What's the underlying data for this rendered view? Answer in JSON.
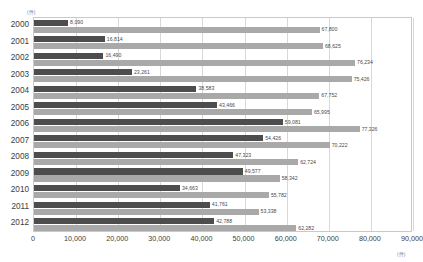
{
  "chart_data": {
    "type": "bar",
    "orientation": "horizontal",
    "title": "",
    "xlabel": "(件)",
    "ylabel": "(件)",
    "unit_top": "(件)",
    "unit_bottom": "(件)",
    "xlim": [
      0,
      90000
    ],
    "grid": true,
    "grid_axis": "x",
    "legend_position": "none",
    "xticks": [
      0,
      10000,
      20000,
      30000,
      40000,
      50000,
      60000,
      70000,
      80000,
      90000
    ],
    "xtick_labels": [
      "0",
      "10,000",
      "20,000",
      "30,000",
      "40,000",
      "50,000",
      "60,000",
      "70,000",
      "80,000",
      "90,000"
    ],
    "categories": [
      "2000",
      "2001",
      "2002",
      "2003",
      "2004",
      "2005",
      "2006",
      "2007",
      "2008",
      "2009",
      "2010",
      "2011",
      "2012"
    ],
    "series": [
      {
        "name": "series-dark",
        "color": "#4d4d4d",
        "values": [
          8090,
          16814,
          16490,
          23261,
          38583,
          43466,
          59081,
          54426,
          47323,
          49577,
          34663,
          41761,
          42788
        ],
        "value_labels": [
          "8,090",
          "16,814",
          "16,490",
          "23,261",
          "38,583",
          "43,466",
          "59,081",
          "54,426",
          "47,323",
          "49,577",
          "34,663",
          "41,761",
          "42,788"
        ]
      },
      {
        "name": "series-light",
        "color": "#a9a9a9",
        "values": [
          67800,
          68625,
          76234,
          75426,
          67752,
          65995,
          77326,
          70222,
          62724,
          58342,
          55782,
          53338,
          62282
        ],
        "value_labels": [
          "67,800",
          "68,625",
          "76,234",
          "75,426",
          "67,752",
          "65,995",
          "77,326",
          "70,222",
          "62,724",
          "58,342",
          "55,782",
          "53,338",
          "62,282"
        ]
      }
    ]
  },
  "colors": {
    "dark_bar": "#4d4d4d",
    "light_bar": "#a9a9a9",
    "gridline": "#d8d8d8",
    "frame": "#c9c9c9",
    "text": "#3c3c3c",
    "unit_text": "#8a8a8a",
    "background": "#ffffff"
  }
}
